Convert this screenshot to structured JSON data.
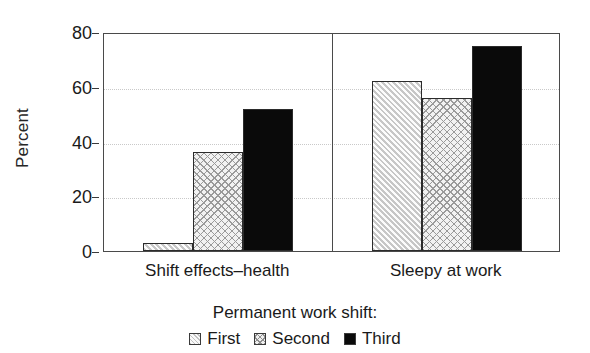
{
  "chart_data": {
    "type": "bar",
    "title": "",
    "xlabel": "Permanent work shift:",
    "ylabel": "Percent",
    "ylim": [
      0,
      80
    ],
    "yticks": [
      0,
      20,
      40,
      60,
      80
    ],
    "ytick_labels": [
      "0",
      "20",
      "40",
      "60",
      "80"
    ],
    "grid": "horizontal-dotted",
    "legend_position": "bottom",
    "legend_title": "Permanent work shift:",
    "categories": [
      "Shift effects–health",
      "Sleepy at work"
    ],
    "series": [
      {
        "name": "First",
        "values": [
          3,
          62
        ],
        "fill": "diagonal-hatch",
        "color": "#c7c7c7"
      },
      {
        "name": "Second",
        "values": [
          36,
          56
        ],
        "fill": "cross-hatch",
        "color": "#f2f2f2"
      },
      {
        "name": "Third",
        "values": [
          52,
          75
        ],
        "fill": "solid",
        "color": "#0a0a0a"
      }
    ]
  },
  "axis": {
    "y_title": "Percent",
    "ticks": [
      {
        "label": "80",
        "value": 80
      },
      {
        "label": "60",
        "value": 60
      },
      {
        "label": "40",
        "value": 40
      },
      {
        "label": "20",
        "value": 20
      },
      {
        "label": "0",
        "value": 0
      }
    ]
  },
  "panels": [
    {
      "label": "Shift effects–health",
      "bars": [
        {
          "series": "First",
          "value": 3
        },
        {
          "series": "Second",
          "value": 36
        },
        {
          "series": "Third",
          "value": 52
        }
      ]
    },
    {
      "label": "Sleepy at work",
      "bars": [
        {
          "series": "First",
          "value": 62
        },
        {
          "series": "Second",
          "value": 56
        },
        {
          "series": "Third",
          "value": 75
        }
      ]
    }
  ],
  "legend": {
    "title": "Permanent work shift:",
    "items": [
      {
        "label": "First",
        "swatch": "diagonal-hatch-swatch"
      },
      {
        "label": "Second",
        "swatch": "cross-hatch-swatch"
      },
      {
        "label": "Third",
        "swatch": "solid-black-swatch"
      }
    ]
  }
}
